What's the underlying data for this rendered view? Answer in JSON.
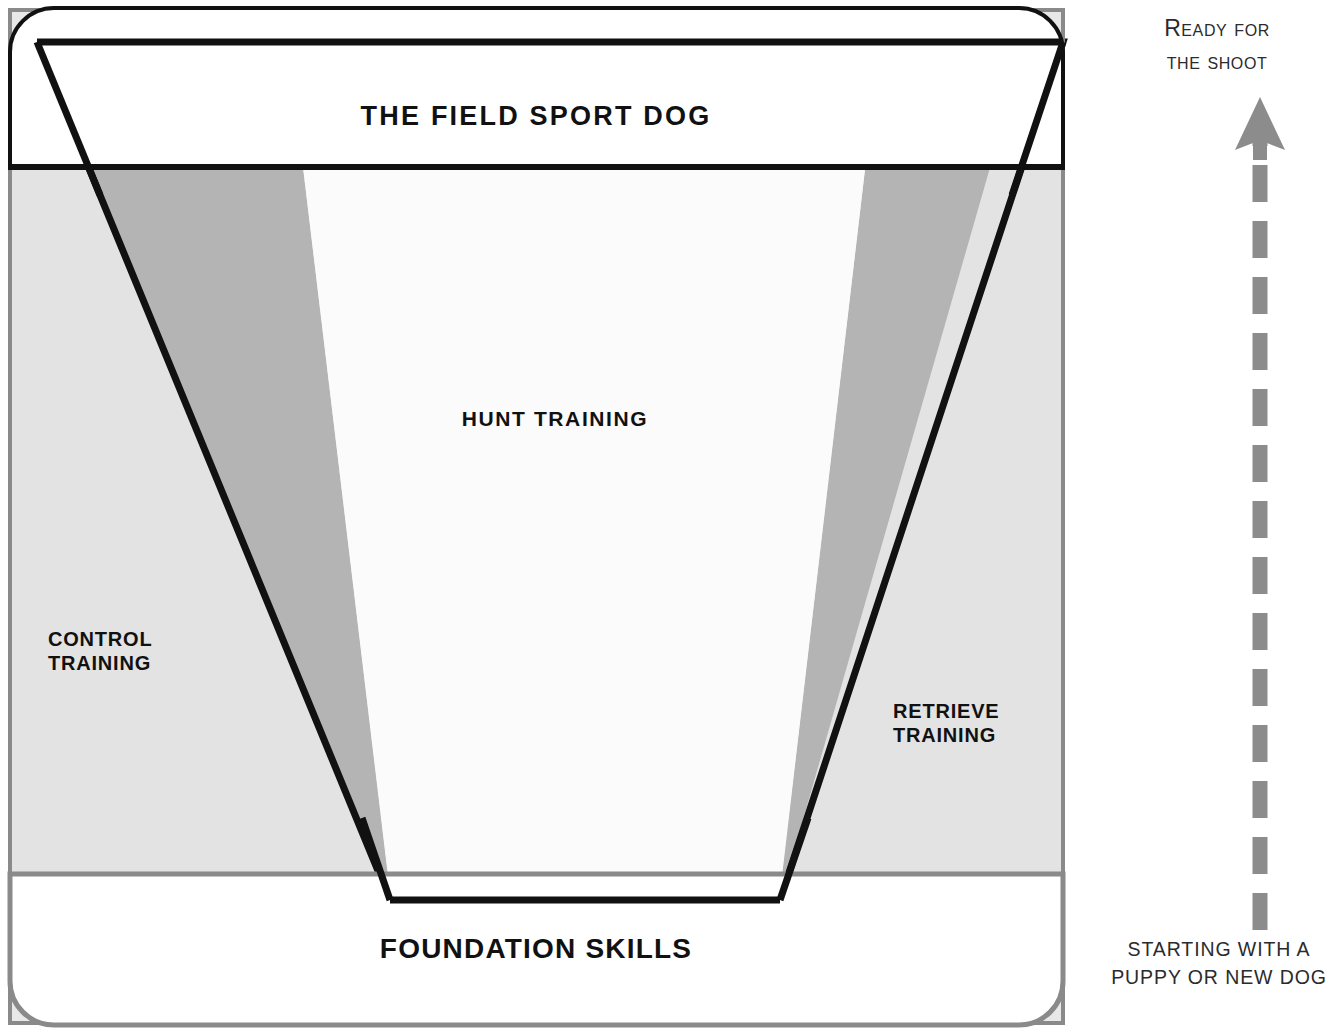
{
  "diagram": {
    "title": "THE FIELD SPORT DOG",
    "type": "funnel-pyramid-training-diagram",
    "banners": {
      "top": {
        "label": "THE FIELD SPORT DOG"
      },
      "bottom": {
        "label": "FOUNDATION SKILLS"
      }
    },
    "zones": [
      {
        "key": "hunt",
        "label": "HUNT TRAINING"
      },
      {
        "key": "control",
        "label": "CONTROL\nTRAINING"
      },
      {
        "key": "retrieve",
        "label": "RETRIEVE\nTRAINING"
      }
    ],
    "progress_arrow": {
      "top_note": "Ready for\nthe shoot",
      "bottom_note": "STARTING WITH A\nPUPPY OR NEW DOG",
      "direction": "up",
      "style": "dashed"
    },
    "colors": {
      "panel_fill": "#e8e8e8",
      "band_fill": "#b4b4b4",
      "center_fill": "#fbfbfb",
      "outline_dark": "#111111",
      "outline_gray": "#8a8a8a",
      "arrow_gray": "#8c8c8c",
      "text_dark": "#111111",
      "background": "#ffffff"
    }
  }
}
